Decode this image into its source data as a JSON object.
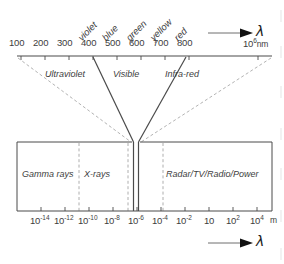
{
  "figure": {
    "top_axis": {
      "unit_label": "nm",
      "end_label_mantissa": "10",
      "end_label_exponent": "6",
      "ticks": [
        "100",
        "200",
        "300",
        "400",
        "500",
        "600",
        "700",
        "800"
      ],
      "arrow_symbol": "λ"
    },
    "bottom_axis": {
      "unit_label": "m",
      "arrow_symbol": "λ",
      "ticks": [
        {
          "mantissa": "10",
          "exponent": "-14"
        },
        {
          "mantissa": "10",
          "exponent": "-12"
        },
        {
          "mantissa": "10",
          "exponent": "-10"
        },
        {
          "mantissa": "10",
          "exponent": "-8"
        },
        {
          "mantissa": "10",
          "exponent": "-6"
        },
        {
          "mantissa": "10",
          "exponent": "-4"
        },
        {
          "mantissa": "10",
          "exponent": "-2"
        },
        {
          "mantissa": "10",
          "exponent": ""
        },
        {
          "mantissa": "10",
          "exponent": "2"
        },
        {
          "mantissa": "10",
          "exponent": "4"
        }
      ]
    },
    "visible_colors": [
      "violet",
      "blue",
      "green",
      "yellow",
      "red"
    ],
    "upper_bands": [
      "Ultraviolet",
      "Visible",
      "Infra-red"
    ],
    "lower_bands": [
      "Gamma rays",
      "X-rays",
      "Radar/TV/Radio/Power"
    ],
    "colors": {
      "line": "#4a4a4a",
      "dashed": "#9a9a9a",
      "text": "#3d3d3d",
      "arrow": "#111111",
      "background": "#ffffff"
    }
  }
}
